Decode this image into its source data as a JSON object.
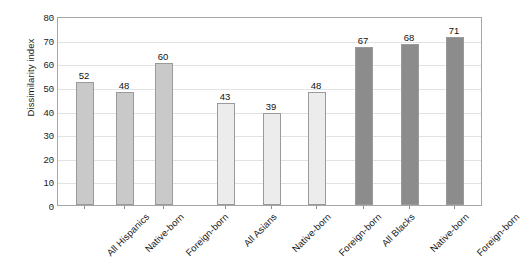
{
  "chart_data": {
    "type": "bar",
    "title": "",
    "xlabel": "",
    "ylabel": "Dissimilarity index",
    "ylim": [
      0,
      80
    ],
    "yticks": [
      0,
      10,
      20,
      30,
      40,
      50,
      60,
      70,
      80
    ],
    "grid": true,
    "legend": "none",
    "groups": [
      {
        "name": "Hispanics",
        "color": "#c9c9c9",
        "categories": [
          "All Hispanics",
          "Native-born",
          "Foreign-born"
        ],
        "values": [
          52,
          48,
          60
        ]
      },
      {
        "name": "Asians",
        "color": "#ececec",
        "categories": [
          "All Asians",
          "Native-born",
          "Foreign-born"
        ],
        "values": [
          43,
          39,
          48
        ]
      },
      {
        "name": "Blacks",
        "color": "#8c8c8c",
        "categories": [
          "All Blacks",
          "Native-born",
          "Foreign-born"
        ],
        "values": [
          67,
          68,
          71
        ]
      }
    ],
    "categories": [
      "All Hispanics",
      "Native-born",
      "Foreign-born",
      "All Asians",
      "Native-born",
      "Foreign-born",
      "All Blacks",
      "Native-born",
      "Foreign-born"
    ],
    "values": [
      52,
      48,
      60,
      43,
      39,
      48,
      67,
      68,
      71
    ]
  }
}
